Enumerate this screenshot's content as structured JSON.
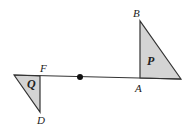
{
  "diagram": {
    "colors": {
      "fill": "#d4d4d4",
      "stroke": "#333333",
      "background": "#ffffff"
    },
    "line": {
      "x1": 14,
      "y1": 75,
      "x2": 181,
      "y2": 79
    },
    "center_point": {
      "x": 80,
      "y": 77,
      "r": 3
    },
    "triangle_P": {
      "label": "P",
      "points": "140,21 140,78 181,79",
      "label_pos": {
        "x": 147,
        "y": 65
      }
    },
    "triangle_Q": {
      "label": "Q",
      "points": "14,75 40,76 40,112",
      "label_pos": {
        "x": 27,
        "y": 88
      }
    },
    "vertex_labels": [
      {
        "name": "B",
        "x": 133,
        "y": 17
      },
      {
        "name": "A",
        "x": 135,
        "y": 92
      },
      {
        "name": "F",
        "x": 40,
        "y": 72
      },
      {
        "name": "D",
        "x": 37,
        "y": 124
      }
    ]
  }
}
